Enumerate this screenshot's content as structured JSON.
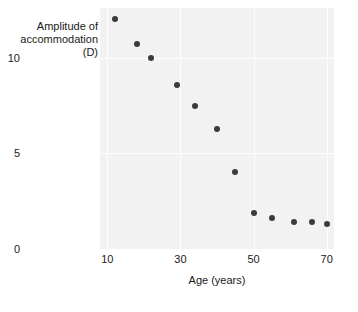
{
  "chart_data": {
    "type": "scatter",
    "title": "",
    "xlabel": "Age (years)",
    "ylabel_lines": [
      "Amplitude of",
      "accommodation",
      "(D)"
    ],
    "ylabel": "Amplitude of accommodation (D)",
    "xlim": [
      8,
      72
    ],
    "ylim": [
      0,
      12.6
    ],
    "xticks": [
      10,
      30,
      50,
      70
    ],
    "xtick_labels": [
      "10",
      "30",
      "50",
      "70"
    ],
    "yticks": [
      0,
      5,
      10
    ],
    "ytick_labels": [
      "0",
      "5",
      "10"
    ],
    "grid": true,
    "grid_color": "#fdfdfd",
    "plot_background": "#f2f2f2",
    "marker_color": "#3b3b3b",
    "x": [
      12,
      18,
      22,
      29,
      34,
      40,
      45,
      50,
      55,
      61,
      66,
      70
    ],
    "y": [
      12.0,
      10.7,
      10.0,
      8.6,
      7.5,
      6.3,
      4.0,
      1.9,
      1.6,
      1.4,
      1.4,
      1.3
    ],
    "points": [
      {
        "x": 12,
        "y": 12.0
      },
      {
        "x": 18,
        "y": 10.7
      },
      {
        "x": 22,
        "y": 10.0
      },
      {
        "x": 29,
        "y": 8.6
      },
      {
        "x": 34,
        "y": 7.5
      },
      {
        "x": 40,
        "y": 6.3
      },
      {
        "x": 45,
        "y": 4.0
      },
      {
        "x": 50,
        "y": 1.9
      },
      {
        "x": 55,
        "y": 1.6
      },
      {
        "x": 61,
        "y": 1.4
      },
      {
        "x": 66,
        "y": 1.4
      },
      {
        "x": 70,
        "y": 1.3
      }
    ],
    "legend": [],
    "annotations": []
  }
}
